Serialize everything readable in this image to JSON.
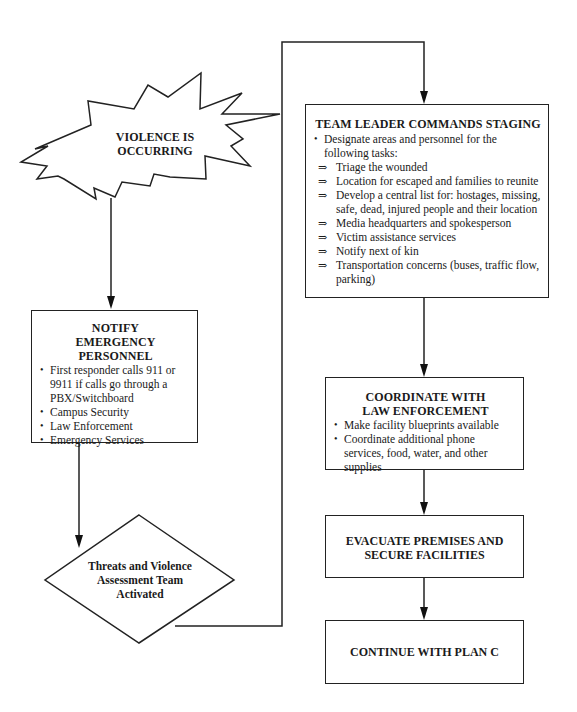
{
  "start": {
    "line1": "VIOLENCE IS",
    "line2": "OCCURRING"
  },
  "notify": {
    "title1": "NOTIFY",
    "title2": "EMERGENCY PERSONNEL",
    "items": [
      "First responder calls 911 or 9911 if calls go through a PBX/Switchboard",
      "Campus Security",
      "Law Enforcement",
      "Emergency Services"
    ]
  },
  "decision": {
    "line1": "Threats and Violence",
    "line2": "Assessment Team",
    "line3": "Activated"
  },
  "staging": {
    "title": "TEAM LEADER COMMANDS STAGING",
    "intro": "Designate areas and personnel for the following tasks:",
    "arrow_glyph": "⇒",
    "tasks": [
      "Triage the wounded",
      "Location for escaped and families to reunite",
      "Develop a central list for:  hostages, missing, safe, dead, injured people and their location",
      "Media headquarters and spokesperson",
      "Victim assistance services",
      "Notify next of kin",
      "Transportation concerns (buses, traffic flow, parking)"
    ]
  },
  "coordinate": {
    "title1": "COORDINATE WITH",
    "title2": "LAW ENFORCEMENT",
    "items": [
      "Make facility blueprints available",
      "Coordinate additional phone services, food, water, and other supplies"
    ]
  },
  "evacuate": {
    "line1": "EVACUATE PREMISES AND",
    "line2": "SECURE FACILITIES"
  },
  "continue": {
    "label": "CONTINUE WITH PLAN C"
  }
}
